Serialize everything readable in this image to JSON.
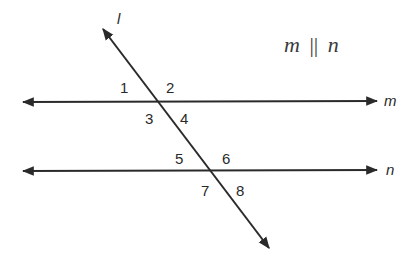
{
  "diagram": {
    "title": "m || n",
    "title_parts": {
      "left": "m",
      "symbol": "||",
      "right": "n"
    },
    "line_color": "#2a2a2a",
    "lines": [
      {
        "id": "l",
        "label": "l",
        "type": "transversal",
        "from": [
          103,
          29
        ],
        "to": [
          269,
          248
        ],
        "label_pos": [
          117,
          24
        ]
      },
      {
        "id": "m",
        "label": "m",
        "type": "parallel",
        "from": [
          23,
          102
        ],
        "to": [
          377,
          101
        ],
        "label_pos": [
          384,
          106
        ]
      },
      {
        "id": "n",
        "label": "n",
        "type": "parallel",
        "from": [
          23,
          171
        ],
        "to": [
          377,
          170
        ],
        "label_pos": [
          386,
          175
        ]
      }
    ],
    "intersections": [
      {
        "lines": [
          "l",
          "m"
        ],
        "point": [
          159,
          102
        ]
      },
      {
        "lines": [
          "l",
          "n"
        ],
        "point": [
          210,
          170
        ]
      }
    ],
    "angles": [
      {
        "label": "1",
        "pos": [
          120,
          93
        ]
      },
      {
        "label": "2",
        "pos": [
          166,
          93
        ]
      },
      {
        "label": "3",
        "pos": [
          145,
          124
        ]
      },
      {
        "label": "4",
        "pos": [
          180,
          124
        ]
      },
      {
        "label": "5",
        "pos": [
          175,
          164
        ]
      },
      {
        "label": "6",
        "pos": [
          222,
          164
        ]
      },
      {
        "label": "7",
        "pos": [
          201,
          196
        ]
      },
      {
        "label": "8",
        "pos": [
          236,
          196
        ]
      }
    ]
  }
}
